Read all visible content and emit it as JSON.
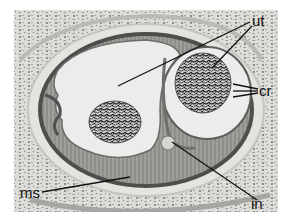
{
  "figure": {
    "type": "histology-micrograph",
    "background_color": "#ffffff",
    "tissue_bg_color": "#d9d9d6",
    "lumen_color": "#ececea",
    "wall_color": "#5a5a58",
    "label_color": "#111111"
  },
  "labels": {
    "ut": {
      "text": "ut",
      "leader_lines": 2
    },
    "cr": {
      "text": "cr",
      "leader_lines": 3
    },
    "ms": {
      "text": "ms",
      "leader_lines": 1
    },
    "in": {
      "text": "in",
      "leader_lines": 1
    }
  }
}
